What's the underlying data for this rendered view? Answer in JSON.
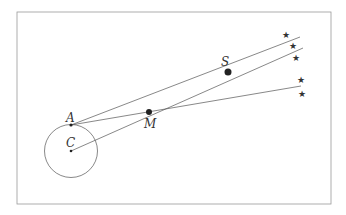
{
  "diagram": {
    "labels": {
      "A": "A",
      "C": "C",
      "M": "M",
      "S": "S"
    },
    "star_glyph": "★",
    "colors": {
      "line": "#555555",
      "frame": "#888888",
      "point": "#222222"
    }
  }
}
